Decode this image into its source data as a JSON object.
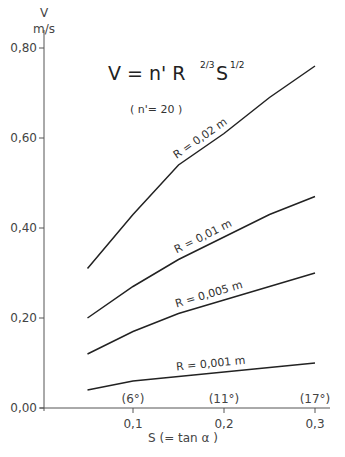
{
  "chart_data": {
    "type": "line",
    "subtitle": "( n' = 20 )",
    "xlabel": "S (= tan α )",
    "ylabel": "V",
    "yunit": "m/s",
    "xlim": [
      0,
      0.32
    ],
    "ylim": [
      0,
      0.8
    ],
    "x_ticks": [
      "0,1",
      "0,2",
      "0,3"
    ],
    "x_tick_values": [
      0.1,
      0.2,
      0.3
    ],
    "x_tick_angles": [
      "(6°)",
      "(11°)",
      "(17°)"
    ],
    "y_ticks": [
      "0,00",
      "0,20",
      "0,40",
      "0,60",
      "0,80"
    ],
    "y_tick_values": [
      0,
      0.2,
      0.4,
      0.6,
      0.8
    ],
    "grid": false,
    "legend": "inline labels on curves",
    "x": [
      0.05,
      0.1,
      0.15,
      0.2,
      0.25,
      0.3
    ],
    "series": [
      {
        "name": "R = 0,02 m",
        "values": [
          0.31,
          0.43,
          0.54,
          0.61,
          0.69,
          0.76
        ]
      },
      {
        "name": "R = 0,01 m",
        "values": [
          0.2,
          0.27,
          0.33,
          0.38,
          0.43,
          0.47
        ]
      },
      {
        "name": "R = 0,005 m",
        "values": [
          0.12,
          0.17,
          0.21,
          0.24,
          0.27,
          0.3
        ]
      },
      {
        "name": "R = 0,001 m",
        "values": [
          0.04,
          0.06,
          0.07,
          0.08,
          0.09,
          0.1
        ]
      }
    ]
  },
  "labels": {
    "y_axis_var": "V",
    "y_axis_unit": "m/s",
    "x_axis_title": "S (= tan α )",
    "formula_main": "V = n' R",
    "formula_exp_r": "2/3",
    "formula_s": "S",
    "formula_exp_s": "1/2",
    "formula_note": "( n'= 20 )"
  }
}
